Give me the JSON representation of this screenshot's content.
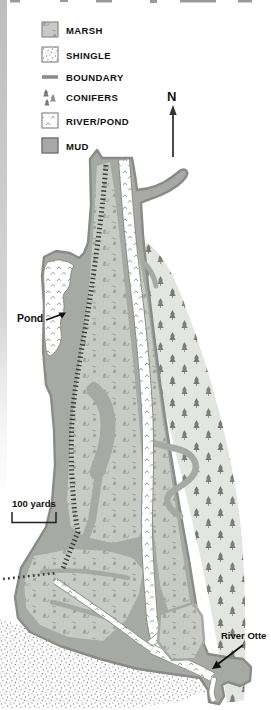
{
  "legend": {
    "items": [
      {
        "key": "marsh",
        "label": "MARSH"
      },
      {
        "key": "shingle",
        "label": "SHINGLE"
      },
      {
        "key": "boundary",
        "label": "BOUNDARY"
      },
      {
        "key": "conifers",
        "label": "CONIFERS"
      },
      {
        "key": "river_pond",
        "label": "RIVER/POND"
      },
      {
        "key": "mud",
        "label": "MUD"
      }
    ]
  },
  "compass": {
    "label": "N"
  },
  "map_labels": {
    "pond": "Pond",
    "scale": "100 yards",
    "river": "River Otte"
  },
  "colors": {
    "mud": "#a6a9a4",
    "marsh": "#c8cbc4",
    "conifer_area": "#e3e5e1",
    "outline": "#878c86",
    "river_mark": "#8a8e88",
    "boundary_line": "#3d3d3d",
    "shingle_dot": "#909090",
    "tree": "#757b72",
    "text": "#111111"
  }
}
